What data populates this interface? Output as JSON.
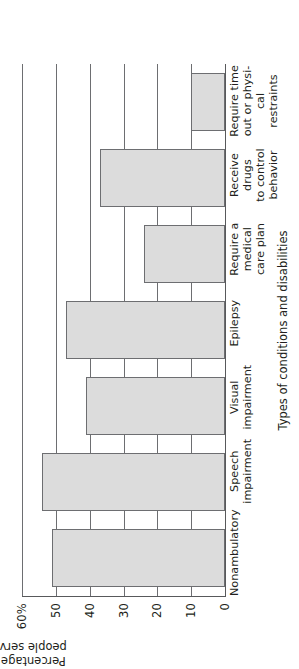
{
  "chart_data": {
    "type": "bar",
    "title": "",
    "xlabel": "Types of conditions and disabilities",
    "ylabel": "Percentage of\npeople served",
    "ylabel_line1": "Percentage of",
    "ylabel_line2": "people served",
    "ylim": [
      0,
      60
    ],
    "yticks": [
      0,
      10,
      20,
      30,
      40,
      50,
      60
    ],
    "ytick_labels": [
      "0",
      "10",
      "20",
      "30",
      "40",
      "50",
      "60%"
    ],
    "grid": true,
    "grid_axis": "y",
    "legend": "none",
    "orientation": "vertical",
    "bar_color": "#dcdcdc",
    "bar_edge_color": "#6d6e71",
    "categories": [
      "Nonambulatory",
      "Speech impairment",
      "Visual impairment",
      "Epilepsy",
      "Require a medical care plan",
      "Receive drugs to control behavior",
      "Require time out or physical restraints"
    ],
    "category_label_lines": [
      [
        "Nonambulatory"
      ],
      [
        "Speech",
        "impairment"
      ],
      [
        "Visual",
        "impairment"
      ],
      [
        "Epilepsy"
      ],
      [
        "Require a",
        "medical",
        "care plan"
      ],
      [
        "Receive drugs",
        "to control",
        "behavior"
      ],
      [
        "Require time",
        "out or physi-",
        "cal restraints"
      ]
    ],
    "values": [
      51,
      54,
      41,
      47,
      24,
      37,
      10
    ]
  }
}
